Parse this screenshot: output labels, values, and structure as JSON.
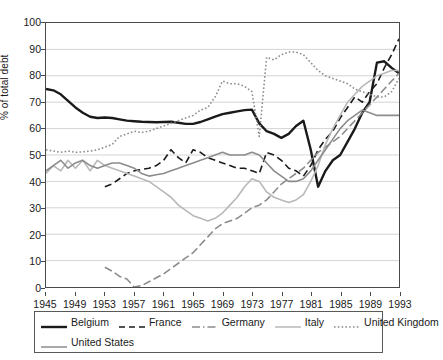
{
  "chart_data": {
    "type": "line",
    "title": "",
    "xlabel": "",
    "ylabel": "% of total debt",
    "xlim": [
      1945,
      1993
    ],
    "ylim": [
      0,
      100
    ],
    "grid": true,
    "grid_axis": "y",
    "legend_position": "below",
    "y_ticks": [
      0,
      10,
      20,
      30,
      40,
      50,
      60,
      70,
      80,
      90,
      100
    ],
    "x_ticks": [
      1945,
      1949,
      1953,
      1957,
      1961,
      1965,
      1969,
      1973,
      1977,
      1981,
      1985,
      1989,
      1993
    ],
    "x_tick_labels": [
      "1945",
      "1949",
      "1953",
      "1957",
      "1961",
      "1965",
      "1969",
      "1973",
      "1977",
      "1981",
      "1985",
      "1989",
      "1993"
    ],
    "y_tick_labels": [
      "0",
      "10",
      "20",
      "30",
      "40",
      "50",
      "60",
      "70",
      "80",
      "90",
      "100"
    ],
    "series": [
      {
        "name": "Belgium",
        "style": "solid",
        "color": "#1a1a1a",
        "width": 2.4,
        "x": [
          1945,
          1946,
          1947,
          1948,
          1949,
          1950,
          1951,
          1952,
          1953,
          1954,
          1955,
          1956,
          1957,
          1958,
          1959,
          1960,
          1961,
          1962,
          1963,
          1964,
          1965,
          1966,
          1967,
          1968,
          1969,
          1970,
          1971,
          1972,
          1973,
          1974,
          1975,
          1976,
          1977,
          1978,
          1979,
          1980,
          1981,
          1982,
          1983,
          1984,
          1985,
          1986,
          1987,
          1988,
          1989,
          1990,
          1991,
          1992,
          1993
        ],
        "values": [
          75,
          74.5,
          73,
          70.5,
          68,
          66,
          64.5,
          64,
          64.2,
          64,
          63.5,
          63,
          62.8,
          62.6,
          62.5,
          62.4,
          62.5,
          62.6,
          62.2,
          61.8,
          61.8,
          62.5,
          63.5,
          64.5,
          65.5,
          66,
          66.5,
          67,
          67.2,
          62,
          59,
          58,
          56.5,
          58,
          61,
          63,
          52,
          38,
          44,
          48,
          50,
          55,
          60,
          66,
          70,
          85,
          85.5,
          83,
          81
        ]
      },
      {
        "name": "France",
        "style": "dashed",
        "color": "#1a1a1a",
        "width": 1.6,
        "x": [
          1953,
          1954,
          1955,
          1956,
          1957,
          1958,
          1959,
          1960,
          1961,
          1962,
          1963,
          1964,
          1965,
          1966,
          1967,
          1968,
          1969,
          1970,
          1971,
          1972,
          1973,
          1974,
          1975,
          1976,
          1977,
          1978,
          1979,
          1980,
          1981,
          1982,
          1983,
          1984,
          1985,
          1986,
          1987,
          1988,
          1989,
          1990,
          1991,
          1992,
          1993
        ],
        "values": [
          38,
          39,
          41,
          43,
          44,
          44.5,
          45,
          46,
          48,
          52,
          49,
          47,
          52,
          51,
          49,
          48,
          47,
          46,
          45,
          45,
          44,
          43,
          51,
          50,
          48,
          45,
          44,
          42,
          46,
          52,
          56,
          59,
          64,
          68,
          72,
          70,
          74,
          77,
          83,
          88,
          94
        ]
      },
      {
        "name": "Germany",
        "style": "dashdot",
        "color": "#8c8c8c",
        "width": 1.6,
        "x": [
          1953,
          1954,
          1955,
          1956,
          1957,
          1958,
          1959,
          1960,
          1961,
          1962,
          1963,
          1964,
          1965,
          1966,
          1967,
          1968,
          1969,
          1970,
          1971,
          1972,
          1973,
          1974,
          1975,
          1976,
          1977,
          1978,
          1979,
          1980,
          1981,
          1982,
          1983,
          1984,
          1985,
          1986,
          1987,
          1988,
          1989,
          1990,
          1991,
          1992,
          1993
        ],
        "values": [
          7.5,
          6,
          4,
          3,
          0,
          0.5,
          2,
          3.5,
          5,
          7,
          9,
          11,
          13,
          16,
          19,
          22,
          24,
          25,
          26,
          28,
          30,
          31,
          33,
          36,
          39,
          41,
          43,
          45,
          48,
          51,
          53,
          55,
          57,
          60,
          63,
          66,
          69,
          72,
          75,
          78,
          81
        ]
      },
      {
        "name": "Italy",
        "style": "solid",
        "color": "#b8b8b8",
        "width": 1.6,
        "x": [
          1945,
          1946,
          1947,
          1948,
          1949,
          1950,
          1951,
          1952,
          1953,
          1954,
          1955,
          1956,
          1957,
          1958,
          1959,
          1960,
          1961,
          1962,
          1963,
          1964,
          1965,
          1966,
          1967,
          1968,
          1969,
          1970,
          1971,
          1972,
          1973,
          1974,
          1975,
          1976,
          1977,
          1978,
          1979,
          1980,
          1981,
          1982,
          1983,
          1984,
          1985,
          1986,
          1987,
          1988,
          1989,
          1990,
          1991,
          1992,
          1993
        ],
        "values": [
          43,
          46,
          44,
          48,
          45,
          48,
          44,
          48,
          46,
          45,
          44,
          43,
          42,
          41,
          40,
          38,
          36,
          34,
          31,
          29,
          27,
          26,
          25,
          26,
          28,
          31,
          34,
          38,
          41,
          40,
          36,
          34,
          33,
          32,
          33,
          35,
          40,
          46,
          54,
          60,
          65,
          70,
          73,
          76,
          78,
          80,
          81,
          82,
          82
        ]
      },
      {
        "name": "United Kingdom",
        "style": "dotted",
        "color": "#8c8c8c",
        "width": 1.6,
        "x": [
          1945,
          1946,
          1947,
          1948,
          1949,
          1950,
          1951,
          1952,
          1953,
          1954,
          1955,
          1956,
          1957,
          1958,
          1959,
          1960,
          1961,
          1962,
          1963,
          1964,
          1965,
          1966,
          1967,
          1968,
          1969,
          1970,
          1971,
          1972,
          1973,
          1974,
          1975,
          1976,
          1977,
          1978,
          1979,
          1980,
          1981,
          1982,
          1983,
          1984,
          1985,
          1986,
          1987,
          1988,
          1989,
          1990,
          1991,
          1992,
          1993
        ],
        "values": [
          52,
          51.5,
          51,
          51.5,
          51,
          51.2,
          51.5,
          52,
          53,
          54,
          57,
          58,
          59,
          58.5,
          59,
          60,
          61,
          62,
          63,
          64,
          65,
          67,
          68,
          72,
          78,
          77,
          77,
          76,
          74,
          57,
          87,
          86,
          88,
          89,
          89,
          88,
          85,
          82,
          80,
          79,
          78,
          77,
          75,
          74,
          73,
          72,
          72,
          74,
          79
        ]
      },
      {
        "name": "United States",
        "style": "solid",
        "color": "#8c8c8c",
        "width": 1.6,
        "x": [
          1945,
          1946,
          1947,
          1948,
          1949,
          1950,
          1951,
          1952,
          1953,
          1954,
          1955,
          1956,
          1957,
          1958,
          1959,
          1960,
          1961,
          1962,
          1963,
          1964,
          1965,
          1966,
          1967,
          1968,
          1969,
          1970,
          1971,
          1972,
          1973,
          1974,
          1975,
          1976,
          1977,
          1978,
          1979,
          1980,
          1981,
          1982,
          1983,
          1984,
          1985,
          1986,
          1987,
          1988,
          1989,
          1990,
          1991,
          1992,
          1993
        ],
        "values": [
          44,
          46,
          48,
          45,
          47,
          48,
          46,
          45,
          46,
          47,
          47,
          46,
          45,
          43,
          42,
          42.5,
          43,
          44,
          45,
          46,
          47,
          48,
          49,
          50,
          51,
          50,
          50,
          50,
          51,
          50,
          47,
          44,
          42,
          40,
          40,
          41,
          44,
          48,
          52,
          56,
          60,
          63,
          65,
          67,
          66,
          65,
          65,
          65,
          65
        ]
      }
    ]
  },
  "axes": {
    "y_label": "% of total debt"
  },
  "legend": {
    "rows": [
      [
        {
          "label": "Belgium",
          "style": "solid-thick",
          "color": "#1a1a1a"
        },
        {
          "label": "France",
          "style": "dashed",
          "color": "#1a1a1a"
        },
        {
          "label": "Germany",
          "style": "dashdot",
          "color": "#8c8c8c"
        },
        {
          "label": "Italy",
          "style": "solid",
          "color": "#b8b8b8"
        },
        {
          "label": "United Kingdom",
          "style": "dotted",
          "color": "#8c8c8c"
        }
      ],
      [
        {
          "label": "United States",
          "style": "solid",
          "color": "#8c8c8c"
        }
      ]
    ]
  }
}
